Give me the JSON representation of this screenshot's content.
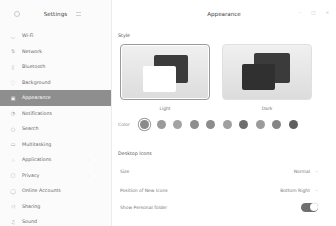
{
  "sidebar": {
    "title": "Settings",
    "items": [
      {
        "label": "Wi-Fi",
        "icon": "wifi-icon",
        "glyph": "◡"
      },
      {
        "label": "Network",
        "icon": "network-icon",
        "glyph": "⇅"
      },
      {
        "label": "Bluetooth",
        "icon": "bluetooth-icon",
        "glyph": "▯"
      },
      {
        "label": "Background",
        "icon": "background-icon",
        "glyph": "◌"
      },
      {
        "label": "Appearance",
        "icon": "appearance-icon",
        "glyph": "▣",
        "active": true
      },
      {
        "label": "Notifications",
        "icon": "bell-icon",
        "glyph": "◔"
      },
      {
        "label": "Search",
        "icon": "search-icon",
        "glyph": "○"
      },
      {
        "label": "Multitasking",
        "icon": "multitasking-icon",
        "glyph": "▭"
      },
      {
        "label": "Applications",
        "icon": "applications-icon",
        "glyph": "⁘",
        "chevron": true
      },
      {
        "label": "Privacy",
        "icon": "privacy-icon",
        "glyph": "▢",
        "chevron": true
      },
      {
        "label": "Online Accounts",
        "icon": "accounts-icon",
        "glyph": "◯"
      },
      {
        "label": "Sharing",
        "icon": "sharing-icon",
        "glyph": "◁"
      },
      {
        "label": "Sound",
        "icon": "sound-icon",
        "glyph": "♫"
      }
    ]
  },
  "header": {
    "title": "Appearance",
    "controls": {
      "minimize": "–",
      "maximize": "□",
      "close": "×"
    }
  },
  "style": {
    "label": "Style",
    "themes": [
      {
        "name": "Light",
        "selected": true
      },
      {
        "name": "Dark",
        "selected": false
      }
    ],
    "color_label": "Color",
    "colors": [
      "#8a8a8a",
      "#9a9a9a",
      "#a3a3a3",
      "#8f8f8f",
      "#8c8c8c",
      "#a0a0a0",
      "#6e6e6e",
      "#9b9b9b",
      "#858585",
      "#5f5f5f"
    ],
    "selected_color_index": 0
  },
  "desktop_icons": {
    "label": "Desktop Icons",
    "size": {
      "label": "Size",
      "value": "Normal"
    },
    "position": {
      "label": "Position of New Icons",
      "value": "Bottom Right"
    },
    "personal_folder": {
      "label": "Show Personal folder",
      "enabled": true
    }
  }
}
